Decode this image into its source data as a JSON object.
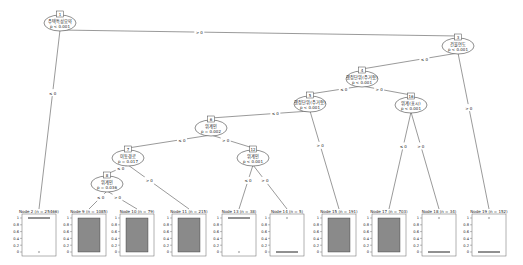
{
  "tree": {
    "inner_nodes": [
      {
        "id": "1",
        "label": "주택특성요약",
        "p": "p < 0.001",
        "x": 60,
        "y": 22
      },
      {
        "id": "3",
        "label": "건물연도",
        "p": "p < 0.001",
        "x": 458,
        "y": 45
      },
      {
        "id": "4",
        "label": "행정단위(주거형)",
        "p": "p < 0.001",
        "x": 362,
        "y": 78
      },
      {
        "id": "5",
        "label": "행정단위(주거형)",
        "p": "p < 0.001",
        "x": 310,
        "y": 103
      },
      {
        "id": "6",
        "label": "위계인",
        "p": "p = 0.002",
        "x": 211,
        "y": 127
      },
      {
        "id": "7",
        "label": "이동경로",
        "p": "p = 0.017",
        "x": 128,
        "y": 157
      },
      {
        "id": "8",
        "label": "위계인",
        "p": "p = 0.036",
        "x": 107,
        "y": 183
      },
      {
        "id": "12",
        "label": "위계인",
        "p": "p < 0.001",
        "x": 253,
        "y": 157
      },
      {
        "id": "16",
        "label": "위계(표시)",
        "p": "p < 0.001",
        "x": 411,
        "y": 104
      }
    ],
    "edges": [
      {
        "from": "1",
        "to": "2",
        "label": "≤ 0"
      },
      {
        "from": "1",
        "to": "3",
        "label": "> 0"
      },
      {
        "from": "3",
        "to": "4",
        "label": "≤ 0"
      },
      {
        "from": "3",
        "to": "19",
        "label": "> 0"
      },
      {
        "from": "4",
        "to": "5",
        "label": "≤ 0"
      },
      {
        "from": "4",
        "to": "16",
        "label": "> 0"
      },
      {
        "from": "5",
        "to": "6",
        "label": "≤ 0"
      },
      {
        "from": "5",
        "to": "15",
        "label": "> 0"
      },
      {
        "from": "6",
        "to": "7",
        "label": "≤ 0"
      },
      {
        "from": "6",
        "to": "12",
        "label": "> 0"
      },
      {
        "from": "7",
        "to": "8",
        "label": "≤ 0"
      },
      {
        "from": "7",
        "to": "11",
        "label": "> 0"
      },
      {
        "from": "8",
        "to": "9",
        "label": "≤ 0"
      },
      {
        "from": "8",
        "to": "10",
        "label": "> 0"
      },
      {
        "from": "12",
        "to": "13",
        "label": "≤ 0"
      },
      {
        "from": "12",
        "to": "14",
        "label": "> 0"
      },
      {
        "from": "16",
        "to": "17",
        "label": "≤ 0"
      },
      {
        "from": "16",
        "to": "18",
        "label": "> 0"
      }
    ],
    "terminal_nodes": [
      {
        "id": "2",
        "title": "Node 2 (n = 25466)",
        "x": 22,
        "type": "low"
      },
      {
        "id": "9",
        "title": "Node 9 (n = 1085)",
        "x": 72,
        "type": "high"
      },
      {
        "id": "10",
        "title": "Node 10 (n = 79)",
        "x": 120,
        "type": "high"
      },
      {
        "id": "11",
        "title": "Node 11 (n = 215)",
        "x": 172,
        "type": "high"
      },
      {
        "id": "13",
        "title": "Node 13 (n = 38)",
        "x": 222,
        "type": "low"
      },
      {
        "id": "14",
        "title": "Node 14 (n = 5)",
        "x": 270,
        "type": "zero"
      },
      {
        "id": "15",
        "title": "Node 15 (n = 191)",
        "x": 322,
        "type": "high"
      },
      {
        "id": "17",
        "title": "Node 17 (n = 703)",
        "x": 372,
        "type": "high"
      },
      {
        "id": "18",
        "title": "Node 18 (n = 34)",
        "x": 422,
        "type": "zero"
      },
      {
        "id": "19",
        "title": "Node 19 (n = 152)",
        "x": 472,
        "type": "zero"
      }
    ],
    "y_ticks": [
      "1",
      "0.8",
      "0.6",
      "0.4",
      "0.2",
      "0"
    ]
  }
}
